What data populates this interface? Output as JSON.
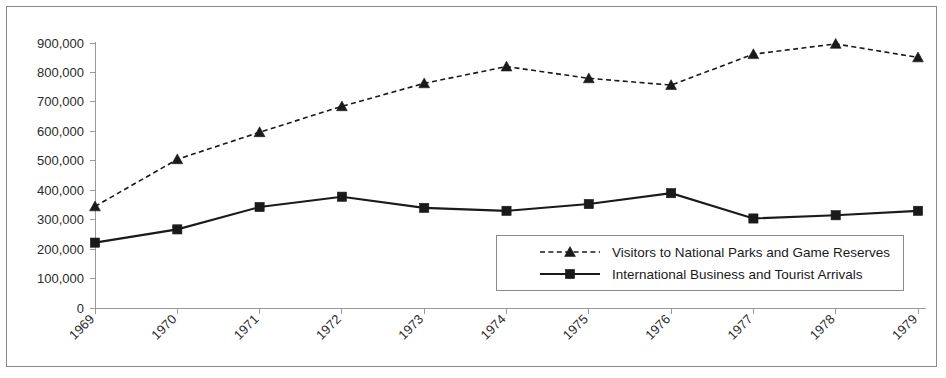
{
  "chart_data": {
    "type": "line",
    "title": "",
    "xlabel": "",
    "ylabel": "",
    "categories": [
      "1969",
      "1970",
      "1971",
      "1972",
      "1973",
      "1974",
      "1975",
      "1976",
      "1977",
      "1978",
      "1979"
    ],
    "ylim": [
      0,
      900000
    ],
    "ytick_step": 100000,
    "ytick_labels": [
      "900,000",
      "800,000",
      "700,000",
      "600,000",
      "500,000",
      "400,000",
      "300,000",
      "200,000",
      "100,000",
      "0"
    ],
    "ytick_values": [
      900000,
      800000,
      700000,
      600000,
      500000,
      400000,
      300000,
      200000,
      100000,
      0
    ],
    "grid": false,
    "legend_position": "inside-lower-right",
    "series": [
      {
        "name": "Visitors to National Parks and Game Reserves",
        "style": "dashed",
        "marker": "triangle",
        "color": "#1a1a1a",
        "values": [
          345000,
          505000,
          597000,
          685000,
          763000,
          820000,
          780000,
          757000,
          862000,
          897000,
          851000
        ]
      },
      {
        "name": "International Business and Tourist Arrivals",
        "style": "solid",
        "marker": "square",
        "color": "#1a1a1a",
        "values": [
          222000,
          267000,
          343000,
          378000,
          340000,
          330000,
          353000,
          390000,
          304000,
          315000,
          330000
        ]
      }
    ]
  },
  "legend": {
    "entries": [
      {
        "label": "Visitors to National Parks and Game Reserves"
      },
      {
        "label": "International Business and Tourist Arrivals"
      }
    ]
  },
  "colors": {
    "ink": "#1a1a1a",
    "axis": "#9a9a9a",
    "frame": "#8a8a8a",
    "background": "#ffffff"
  }
}
